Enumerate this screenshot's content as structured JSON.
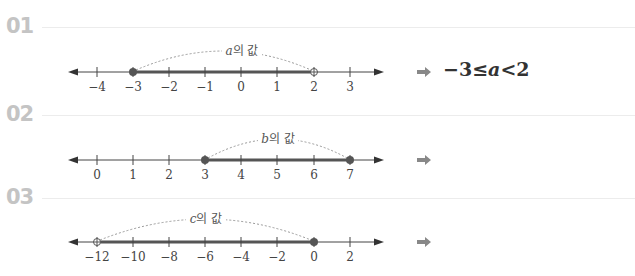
{
  "colors": {
    "label": "#c4c4c4",
    "line": "#444444",
    "range": "#555555",
    "dot": "#555555",
    "arc": "#999999",
    "arrow": "#888888"
  },
  "problems": [
    {
      "number": "01",
      "variable": "a",
      "arc_label_suffix": "의 값",
      "ticks": [
        "-4",
        "-3",
        "-2",
        "-1",
        "0",
        "1",
        "2",
        "3"
      ],
      "range": {
        "from": "-3",
        "from_closed": true,
        "to": "2",
        "to_closed": false
      },
      "answer": "−3≤a<2"
    },
    {
      "number": "02",
      "variable": "b",
      "arc_label_suffix": "의 값",
      "ticks": [
        "0",
        "1",
        "2",
        "3",
        "4",
        "5",
        "6",
        "7"
      ],
      "range": {
        "from": "3",
        "from_closed": true,
        "to": "7",
        "to_closed": true
      },
      "answer": ""
    },
    {
      "number": "03",
      "variable": "c",
      "arc_label_suffix": "의 값",
      "ticks": [
        "-12",
        "-10",
        "-8",
        "-6",
        "-4",
        "-2",
        "0",
        "2"
      ],
      "range": {
        "from": "-12",
        "from_closed": false,
        "to": "0",
        "to_closed": true
      },
      "answer": ""
    }
  ]
}
